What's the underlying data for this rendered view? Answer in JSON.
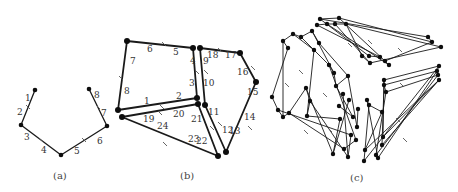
{
  "figure": {
    "captions": [
      {
        "id": "a",
        "text": "(a)",
        "x": 60,
        "y": 179
      },
      {
        "id": "b",
        "text": "(b)",
        "x": 187,
        "y": 179
      },
      {
        "id": "c",
        "text": "(c)",
        "x": 357,
        "y": 181
      }
    ]
  },
  "panel_a": {
    "nodes": [
      [
        35,
        90
      ],
      [
        21,
        125
      ],
      [
        61,
        155
      ],
      [
        107,
        126
      ],
      [
        89,
        89
      ]
    ],
    "edges": [
      [
        0,
        1
      ],
      [
        1,
        2
      ],
      [
        2,
        3
      ],
      [
        3,
        4
      ]
    ],
    "ticks": [
      [
        28,
        107
      ],
      [
        41,
        140
      ],
      [
        84,
        140
      ],
      [
        98,
        107
      ]
    ],
    "labels": [
      {
        "t": "1",
        "x": 25,
        "y": 101
      },
      {
        "t": "2",
        "x": 17,
        "y": 115
      },
      {
        "t": "3",
        "x": 24,
        "y": 140
      },
      {
        "t": "4",
        "x": 41,
        "y": 153
      },
      {
        "t": "5",
        "x": 74,
        "y": 154
      },
      {
        "t": "6",
        "x": 97,
        "y": 144
      },
      {
        "t": "7",
        "x": 101,
        "y": 116
      },
      {
        "t": "8",
        "x": 94,
        "y": 98
      }
    ]
  },
  "panel_b": {
    "nodes": [
      [
        127,
        41
      ],
      [
        193,
        48
      ],
      [
        200,
        48
      ],
      [
        240,
        53
      ],
      [
        256,
        82
      ],
      [
        197,
        98
      ],
      [
        205,
        105
      ],
      [
        118,
        110
      ],
      [
        122,
        117
      ],
      [
        198,
        104
      ],
      [
        226,
        152
      ],
      [
        218,
        156
      ]
    ],
    "thick_edges": [
      [
        0,
        1
      ],
      [
        1,
        5
      ],
      [
        2,
        6
      ],
      [
        2,
        3
      ],
      [
        3,
        4
      ],
      [
        4,
        10
      ],
      [
        0,
        7
      ],
      [
        7,
        5
      ],
      [
        8,
        9
      ],
      [
        9,
        11
      ],
      [
        6,
        10
      ],
      [
        8,
        11
      ]
    ],
    "ticks": [
      [
        164,
        44
      ],
      [
        121,
        78
      ],
      [
        197,
        72
      ],
      [
        206,
        72
      ],
      [
        220,
        50
      ],
      [
        253,
        68
      ],
      [
        162,
        107
      ],
      [
        160,
        113
      ],
      [
        212,
        128
      ],
      [
        220,
        124
      ],
      [
        250,
        128
      ],
      [
        165,
        144
      ]
    ],
    "labels": [
      {
        "t": "1",
        "x": 144,
        "y": 104
      },
      {
        "t": "2",
        "x": 176,
        "y": 99
      },
      {
        "t": "3",
        "x": 189,
        "y": 86
      },
      {
        "t": "4",
        "x": 190,
        "y": 64
      },
      {
        "t": "5",
        "x": 173,
        "y": 55
      },
      {
        "t": "6",
        "x": 147,
        "y": 52
      },
      {
        "t": "7",
        "x": 130,
        "y": 64
      },
      {
        "t": "8",
        "x": 124,
        "y": 94
      },
      {
        "t": "9",
        "x": 203,
        "y": 64
      },
      {
        "t": "10",
        "x": 203,
        "y": 86
      },
      {
        "t": "11",
        "x": 208,
        "y": 115
      },
      {
        "t": "12",
        "x": 222,
        "y": 133
      },
      {
        "t": "13",
        "x": 229,
        "y": 134
      },
      {
        "t": "14",
        "x": 244,
        "y": 120
      },
      {
        "t": "15",
        "x": 247,
        "y": 95
      },
      {
        "t": "16",
        "x": 237,
        "y": 75
      },
      {
        "t": "17",
        "x": 225,
        "y": 58
      },
      {
        "t": "18",
        "x": 207,
        "y": 58
      },
      {
        "t": "19",
        "x": 143,
        "y": 122
      },
      {
        "t": "20",
        "x": 173,
        "y": 117
      },
      {
        "t": "21",
        "x": 191,
        "y": 122
      },
      {
        "t": "22",
        "x": 196,
        "y": 144
      },
      {
        "t": "23",
        "x": 188,
        "y": 142
      },
      {
        "t": "24",
        "x": 157,
        "y": 129
      }
    ]
  },
  "panel_c": {
    "nodes": [
      [
        283,
        41
      ],
      [
        293,
        34
      ],
      [
        301,
        37
      ],
      [
        312,
        31
      ],
      [
        319,
        43
      ],
      [
        288,
        48
      ],
      [
        314,
        50
      ],
      [
        272,
        97
      ],
      [
        278,
        110
      ],
      [
        283,
        117
      ],
      [
        289,
        113
      ],
      [
        306,
        88
      ],
      [
        310,
        101
      ],
      [
        307,
        116
      ],
      [
        329,
        65
      ],
      [
        334,
        73
      ],
      [
        336,
        86
      ],
      [
        348,
        76
      ],
      [
        340,
        119
      ],
      [
        351,
        135
      ],
      [
        344,
        149
      ],
      [
        348,
        157
      ],
      [
        333,
        154
      ],
      [
        353,
        117
      ],
      [
        357,
        127
      ],
      [
        356,
        140
      ],
      [
        343,
        94
      ],
      [
        349,
        100
      ],
      [
        339,
        106
      ],
      [
        358,
        109
      ],
      [
        320,
        19
      ],
      [
        339,
        18
      ],
      [
        317,
        25
      ],
      [
        327,
        24
      ],
      [
        335,
        24
      ],
      [
        346,
        24
      ],
      [
        428,
        37
      ],
      [
        432,
        42
      ],
      [
        441,
        47
      ],
      [
        369,
        56
      ],
      [
        380,
        57
      ],
      [
        385,
        61
      ],
      [
        389,
        65
      ],
      [
        370,
        63
      ],
      [
        362,
        56
      ],
      [
        384,
        80
      ],
      [
        384,
        85
      ],
      [
        386,
        92
      ],
      [
        367,
        100
      ],
      [
        369,
        105
      ],
      [
        382,
        112
      ],
      [
        383,
        137
      ],
      [
        382,
        145
      ],
      [
        376,
        155
      ],
      [
        378,
        158
      ],
      [
        364,
        161
      ],
      [
        365,
        150
      ],
      [
        439,
        66
      ],
      [
        437,
        71
      ],
      [
        438,
        75
      ],
      [
        439,
        80
      ]
    ],
    "edges": [
      [
        0,
        1
      ],
      [
        1,
        2
      ],
      [
        2,
        3
      ],
      [
        0,
        5
      ],
      [
        3,
        4
      ],
      [
        5,
        7
      ],
      [
        0,
        9
      ],
      [
        1,
        6
      ],
      [
        2,
        14
      ],
      [
        4,
        17
      ],
      [
        3,
        15
      ],
      [
        6,
        13
      ],
      [
        7,
        8
      ],
      [
        8,
        9
      ],
      [
        9,
        10
      ],
      [
        10,
        11
      ],
      [
        11,
        12
      ],
      [
        12,
        13
      ],
      [
        14,
        15
      ],
      [
        15,
        16
      ],
      [
        16,
        17
      ],
      [
        13,
        18
      ],
      [
        8,
        19
      ],
      [
        10,
        20
      ],
      [
        12,
        21
      ],
      [
        11,
        22
      ],
      [
        16,
        23
      ],
      [
        17,
        24
      ],
      [
        14,
        25
      ],
      [
        19,
        21
      ],
      [
        18,
        22
      ],
      [
        21,
        26
      ],
      [
        22,
        27
      ],
      [
        23,
        28
      ],
      [
        24,
        29
      ],
      [
        25,
        20
      ],
      [
        30,
        31
      ],
      [
        32,
        33
      ],
      [
        33,
        34
      ],
      [
        34,
        35
      ],
      [
        30,
        39
      ],
      [
        31,
        41
      ],
      [
        32,
        40
      ],
      [
        33,
        42
      ],
      [
        34,
        43
      ],
      [
        35,
        44
      ],
      [
        30,
        36
      ],
      [
        31,
        37
      ],
      [
        35,
        38
      ],
      [
        36,
        37
      ],
      [
        39,
        40
      ],
      [
        41,
        42
      ],
      [
        43,
        44
      ],
      [
        37,
        41
      ],
      [
        38,
        43
      ],
      [
        45,
        46
      ],
      [
        46,
        47
      ],
      [
        48,
        49
      ],
      [
        49,
        50
      ],
      [
        45,
        51
      ],
      [
        46,
        52
      ],
      [
        47,
        53
      ],
      [
        48,
        54
      ],
      [
        49,
        55
      ],
      [
        50,
        56
      ],
      [
        45,
        57
      ],
      [
        46,
        58
      ],
      [
        47,
        59
      ],
      [
        51,
        60
      ],
      [
        52,
        60
      ],
      [
        53,
        59
      ],
      [
        54,
        58
      ],
      [
        55,
        57
      ],
      [
        56,
        60
      ],
      [
        57,
        58
      ]
    ],
    "ticks": [
      [
        287,
        85
      ],
      [
        301,
        72
      ],
      [
        325,
        95
      ],
      [
        306,
        132
      ],
      [
        330,
        130
      ],
      [
        350,
        45
      ],
      [
        370,
        42
      ],
      [
        400,
        50
      ],
      [
        402,
        85
      ],
      [
        398,
        120
      ],
      [
        405,
        140
      ]
    ]
  },
  "colors": {
    "ink": "#111111",
    "tick": "#555555",
    "label": "#333333",
    "background": "#ffffff"
  }
}
